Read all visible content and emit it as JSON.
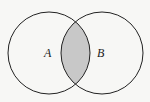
{
  "diagram": {
    "type": "venn",
    "sets": [
      {
        "label": "A",
        "cx": 49,
        "cy": 53,
        "r": 41
      },
      {
        "label": "B",
        "cx": 102,
        "cy": 53,
        "r": 41
      }
    ],
    "shaded_region": "A ∩ B",
    "colors": {
      "background": "#f7f7f5",
      "stroke": "#222222",
      "shade": "#c8c8c8"
    }
  }
}
